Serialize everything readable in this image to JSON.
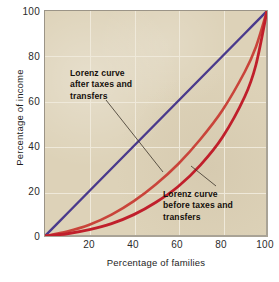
{
  "chart_data": {
    "type": "line",
    "title": "",
    "xlabel": "Percentage of families",
    "ylabel": "Percentage of income",
    "xlim": [
      0,
      100
    ],
    "ylim": [
      0,
      100
    ],
    "xticks": [
      "20",
      "40",
      "60",
      "80",
      "100"
    ],
    "yticks": [
      "0",
      "20",
      "40",
      "60",
      "80",
      "100"
    ],
    "grid": true,
    "legend_position": "annotations-inline",
    "annotations": [
      {
        "id": "after",
        "lines": [
          "Lorenz curve",
          "after taxes and",
          "transfers"
        ],
        "text": "Lorenz curve after taxes and transfers",
        "points_to_series": "lorenz_after_taxes"
      },
      {
        "id": "before",
        "lines": [
          "Lorenz curve",
          "before taxes and",
          "transfers"
        ],
        "text": "Lorenz curve before taxes and transfers",
        "points_to_series": "lorenz_before_taxes"
      }
    ],
    "series": [
      {
        "name": "line_of_equality",
        "label": "Line of perfect equality",
        "color": "#4a3a8c",
        "x": [
          0,
          10,
          20,
          30,
          40,
          50,
          60,
          70,
          80,
          90,
          100
        ],
        "values": [
          0,
          10,
          20,
          30,
          40,
          50,
          60,
          70,
          80,
          90,
          100
        ]
      },
      {
        "name": "lorenz_after_taxes",
        "label": "Lorenz curve after taxes and transfers",
        "color": "#c9443a",
        "x": [
          0,
          10,
          20,
          30,
          40,
          50,
          60,
          70,
          80,
          90,
          95,
          100
        ],
        "values": [
          0,
          2.0,
          5.0,
          9.5,
          15.5,
          23.0,
          32.0,
          43.0,
          56.0,
          73.0,
          84.0,
          100
        ]
      },
      {
        "name": "lorenz_before_taxes",
        "label": "Lorenz curve before taxes and transfers",
        "color": "#c01f2b",
        "x": [
          0,
          10,
          20,
          30,
          40,
          50,
          60,
          70,
          80,
          90,
          95,
          100
        ],
        "values": [
          0,
          1.0,
          2.8,
          5.5,
          9.5,
          15.0,
          22.0,
          31.5,
          44.0,
          62.0,
          76.0,
          100
        ]
      }
    ],
    "colors": {
      "plot_background": "#ddd2b8",
      "gridline": "#efe9da",
      "frame": "#9b9487",
      "equality_line": "#4a3a8c",
      "curve_after": "#c9443a",
      "curve_before": "#c01f2b",
      "text": "#1d1d1d",
      "leader_line": "#3a3228"
    }
  },
  "axes": {
    "yticks": [
      {
        "label": "100",
        "top": 7
      },
      {
        "label": "80",
        "top": 52
      },
      {
        "label": "60",
        "top": 97
      },
      {
        "label": "40",
        "top": 142
      },
      {
        "label": "20",
        "top": 187
      },
      {
        "label": "0",
        "top": 232
      }
    ],
    "xticks": [
      {
        "label": "20",
        "left": 74
      },
      {
        "label": "40",
        "left": 118
      },
      {
        "label": "60",
        "left": 162
      },
      {
        "label": "80",
        "left": 206
      },
      {
        "label": "100",
        "left": 250
      }
    ]
  }
}
